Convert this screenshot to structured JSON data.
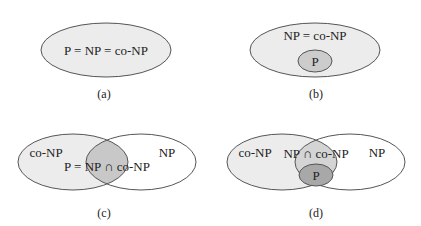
{
  "figure": {
    "colors": {
      "outer_fill": "#ececec",
      "right_fill": "#ffffff",
      "intersection_fill": "#c8c8c8",
      "p_fill_b": "#cccccc",
      "p_fill_d": "#a8a8a8",
      "stroke": "#555555",
      "text": "#222222"
    },
    "panels": [
      {
        "id": "a",
        "caption": "(a)",
        "labels": {
          "main": "P = NP = co-NP"
        }
      },
      {
        "id": "b",
        "caption": "(b)",
        "labels": {
          "outer": "NP = co-NP",
          "inner": "P"
        }
      },
      {
        "id": "c",
        "caption": "(c)",
        "labels": {
          "left": "co-NP",
          "right": "NP",
          "intersection": "P = NP ∩ co-NP"
        }
      },
      {
        "id": "d",
        "caption": "(d)",
        "labels": {
          "left": "co-NP",
          "right": "NP",
          "intersection": "NP ∩ co-NP",
          "inner": "P"
        }
      }
    ]
  }
}
